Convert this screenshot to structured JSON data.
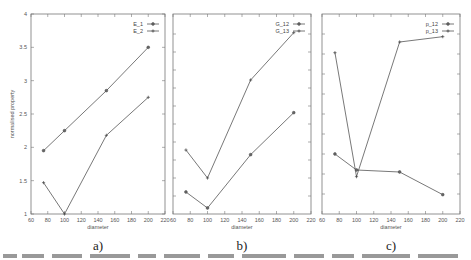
{
  "chart_data": [
    {
      "type": "line",
      "panel_label": "a)",
      "title": "",
      "xlabel": "diameter",
      "ylabel": "normalised property",
      "xlim": [
        60,
        220
      ],
      "ylim": [
        1,
        4
      ],
      "x_ticks": [
        60,
        80,
        100,
        120,
        140,
        160,
        180,
        200,
        220
      ],
      "y_ticks": [
        1,
        1.5,
        2,
        2.5,
        3,
        3.5,
        4
      ],
      "show_y_tick_labels": true,
      "grid": false,
      "legend_position": "top-right",
      "x": [
        75,
        100,
        150,
        200
      ],
      "series": [
        {
          "name": "E_1",
          "marker": "circle",
          "values": [
            1.95,
            2.25,
            2.85,
            3.5
          ]
        },
        {
          "name": "E_2",
          "marker": "plus",
          "values": [
            1.47,
            1.0,
            2.18,
            2.75
          ]
        }
      ]
    },
    {
      "type": "line",
      "panel_label": "b)",
      "title": "",
      "xlabel": "diameter",
      "ylabel": "",
      "xlim": [
        60,
        220
      ],
      "ylim": [
        1,
        4
      ],
      "x_ticks": [
        60,
        80,
        100,
        120,
        140,
        160,
        180,
        200,
        220
      ],
      "y_ticks": [
        1.27,
        1.54,
        1.81,
        2.08,
        2.35,
        2.62,
        2.89,
        3.16,
        3.43,
        3.7
      ],
      "show_y_tick_labels": false,
      "grid": false,
      "legend_position": "top-right",
      "x": [
        75,
        100,
        150,
        200
      ],
      "series": [
        {
          "name": "G_12",
          "marker": "circle",
          "values": [
            1.33,
            1.09,
            1.89,
            2.52
          ]
        },
        {
          "name": "G_13",
          "marker": "plus",
          "values": [
            1.96,
            1.54,
            3.01,
            3.72
          ]
        }
      ]
    },
    {
      "type": "line",
      "panel_label": "c)",
      "title": "",
      "xlabel": "diameter",
      "ylabel": "",
      "xlim": [
        60,
        220
      ],
      "ylim": [
        1,
        4
      ],
      "x_ticks": [
        60,
        80,
        100,
        120,
        140,
        160,
        180,
        200,
        220
      ],
      "y_ticks": [
        1.3,
        1.6,
        1.9,
        2.2,
        2.5,
        2.8,
        3.1,
        3.4,
        3.7
      ],
      "show_y_tick_labels": false,
      "grid": false,
      "legend_position": "top-right",
      "x": [
        75,
        100,
        150,
        200
      ],
      "series": [
        {
          "name": "p_12",
          "marker": "circle",
          "values": [
            1.9,
            1.66,
            1.63,
            1.29
          ]
        },
        {
          "name": "p_13",
          "marker": "plus",
          "values": [
            3.42,
            1.56,
            3.58,
            3.66
          ]
        }
      ]
    }
  ],
  "caption_fragment": "Figure ..."
}
